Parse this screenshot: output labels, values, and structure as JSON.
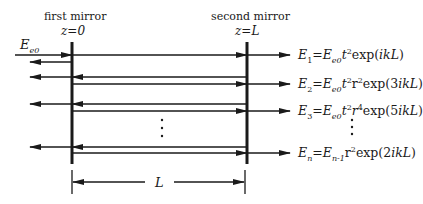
{
  "diagram": {
    "labels": {
      "first_mirror": "first mirror",
      "second_mirror": "second mirror",
      "z0": "z=0",
      "zL": "z=L",
      "input": "E",
      "input_sub": "e0",
      "length": "L"
    },
    "equations": [
      {
        "lhs": "E",
        "lhs_sub": "1",
        "rhs": "=E",
        "rhs_sub": "e0",
        "t": "t",
        "t_sup": "2",
        "r": "",
        "r_sup": "",
        "tail": "exp(",
        "arg": "ikL",
        "close": ")"
      },
      {
        "lhs": "E",
        "lhs_sub": "2",
        "rhs": "=E",
        "rhs_sub": "e0",
        "t": "t",
        "t_sup": "2",
        "r": "r",
        "r_sup": "2",
        "tail": "exp(3",
        "arg": "ikL",
        "close": ")"
      },
      {
        "lhs": "E",
        "lhs_sub": "3",
        "rhs": "=E",
        "rhs_sub": "e0",
        "t": "t",
        "t_sup": "2",
        "r": "r",
        "r_sup": "4",
        "tail": "exp(5",
        "arg": "ikL",
        "close": ")"
      },
      {
        "lhs": "E",
        "lhs_sub": "n",
        "rhs": "=E",
        "rhs_sub": "n-1",
        "t": "",
        "t_sup": "",
        "r": "r",
        "r_sup": "2",
        "tail": "exp(2",
        "arg": "ikL",
        "close": ")"
      }
    ],
    "colors": {
      "line": "#1a1a1a"
    }
  }
}
